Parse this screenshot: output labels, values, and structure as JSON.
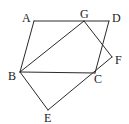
{
  "diagram": {
    "type": "geometry",
    "points": {
      "A": {
        "label": "A",
        "x": 34,
        "y": 21,
        "lx": 22,
        "ly": 22
      },
      "G": {
        "label": "G",
        "x": 84,
        "y": 21,
        "lx": 80,
        "ly": 18
      },
      "D": {
        "label": "D",
        "x": 109,
        "y": 21,
        "lx": 112,
        "ly": 22
      },
      "B": {
        "label": "B",
        "x": 20,
        "y": 72,
        "lx": 8,
        "ly": 80
      },
      "C": {
        "label": "C",
        "x": 95,
        "y": 73,
        "lx": 94,
        "ly": 83
      },
      "F": {
        "label": "F",
        "x": 112,
        "y": 57,
        "lx": 115,
        "ly": 64
      },
      "E": {
        "label": "E",
        "x": 48,
        "y": 110,
        "lx": 44,
        "ly": 122
      }
    },
    "segments": [
      [
        "A",
        "D"
      ],
      [
        "A",
        "B"
      ],
      [
        "D",
        "C"
      ],
      [
        "B",
        "C"
      ],
      [
        "B",
        "G"
      ],
      [
        "G",
        "F"
      ],
      [
        "B",
        "E"
      ],
      [
        "E",
        "F"
      ]
    ],
    "labels": [
      "A",
      "G",
      "D",
      "B",
      "C",
      "F",
      "E"
    ]
  }
}
